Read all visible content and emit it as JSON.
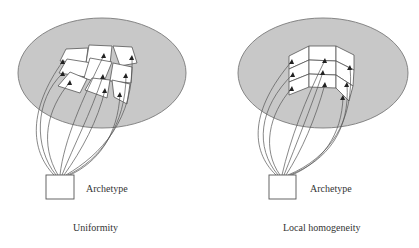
{
  "diagram": {
    "panels": [
      {
        "name": "uniformity",
        "caption": "Uniformity",
        "archetype_label": "Archetype",
        "description": "Archetype box with curved mappings to scattered, independently oriented patches on a gray ellipse"
      },
      {
        "name": "local-homogeneity",
        "caption": "Local homogeneity",
        "archetype_label": "Archetype",
        "description": "Archetype box with curved mappings to a contiguous folded 3x3 grid of patches on a gray ellipse"
      }
    ],
    "colors": {
      "ellipse_fill": "#c8c8c8",
      "ellipse_stroke": "#7a7a7a",
      "line": "#555555",
      "text": "#333333",
      "background": "#ffffff"
    }
  }
}
